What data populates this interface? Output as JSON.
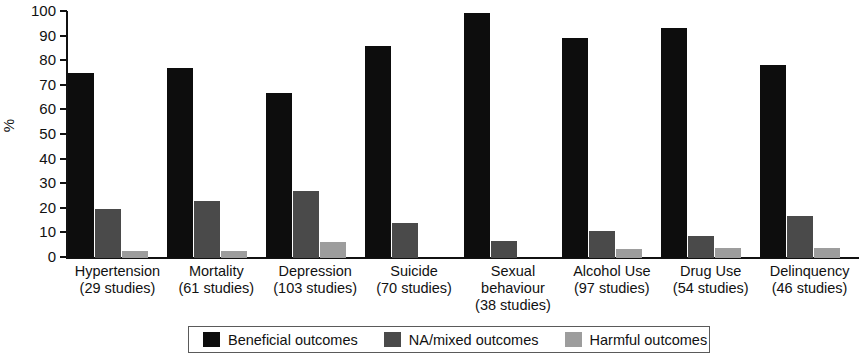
{
  "chart_data": {
    "type": "bar",
    "title": "",
    "xlabel": "",
    "ylabel": "%",
    "ylim": [
      0,
      100
    ],
    "ytick_step": 10,
    "yticks": [
      100,
      90,
      80,
      70,
      60,
      50,
      40,
      30,
      20,
      10,
      0
    ],
    "grid": false,
    "legend_position": "bottom",
    "categories": [
      "Hypertension",
      "Mortality",
      "Depression",
      "Suicide",
      "Sexual\nbehaviour",
      "Alcohol Use",
      "Drug Use",
      "Delinquency"
    ],
    "category_sublabels": [
      "(29 studies)",
      "(61 studies)",
      "(103 studies)",
      "(70 studies)",
      "(38 studies)",
      "(97 studies)",
      "(54 studies)",
      "(46 studies)"
    ],
    "series": [
      {
        "name": "Beneficial outcomes",
        "color": "#0d0d0d",
        "values": [
          75,
          77,
          67,
          86,
          99,
          89,
          93,
          78
        ]
      },
      {
        "name": "NA/mixed outcomes",
        "color": "#4a4a4a",
        "values": [
          20,
          23,
          27,
          14,
          7,
          11,
          9,
          17
        ]
      },
      {
        "name": "Harmful outcomes",
        "color": "#9d9d9d",
        "values": [
          3,
          3,
          6.5,
          0,
          0,
          3.5,
          4,
          4
        ]
      }
    ]
  },
  "legend": {
    "items": [
      {
        "label": "Beneficial outcomes",
        "color": "#0d0d0d"
      },
      {
        "label": "NA/mixed outcomes",
        "color": "#4a4a4a"
      },
      {
        "label": "Harmful outcomes",
        "color": "#9d9d9d"
      }
    ]
  }
}
